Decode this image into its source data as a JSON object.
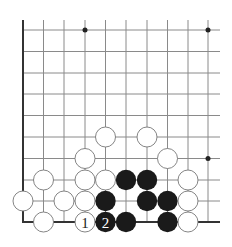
{
  "diagram": {
    "type": "go-board-fragment",
    "corner": "bottom-left",
    "colors": {
      "background": "#ffffff",
      "grid_line": "#8a8a8a",
      "edge_line": "#333333",
      "black_stone": "#1a1a1a",
      "white_stone_fill": "#ffffff",
      "white_stone_stroke": "#777777",
      "star_point": "#222222"
    },
    "grid": {
      "columns_x": [
        23,
        43.5,
        64,
        85,
        105.5,
        126,
        147,
        167.5,
        188,
        208
      ],
      "rows_y": [
        30,
        51.5,
        73,
        94,
        115.5,
        137,
        158.5,
        180,
        201,
        222
      ],
      "extend_top_to": 20,
      "extend_right_to": 220,
      "edges": [
        "left",
        "bottom"
      ]
    },
    "star_points": [
      {
        "col": 3,
        "row": 0
      },
      {
        "col": 9,
        "row": 0
      },
      {
        "col": 9,
        "row": 6
      }
    ],
    "stones": [
      {
        "color": "white",
        "col": 4,
        "row": 5,
        "label": ""
      },
      {
        "color": "white",
        "col": 6,
        "row": 5,
        "label": ""
      },
      {
        "color": "white",
        "col": 3,
        "row": 6,
        "label": ""
      },
      {
        "color": "white",
        "col": 7,
        "row": 6,
        "label": ""
      },
      {
        "color": "white",
        "col": 1,
        "row": 7,
        "label": ""
      },
      {
        "color": "white",
        "col": 3,
        "row": 7,
        "label": ""
      },
      {
        "color": "white",
        "col": 4,
        "row": 7,
        "label": ""
      },
      {
        "color": "black",
        "col": 5,
        "row": 7,
        "label": ""
      },
      {
        "color": "black",
        "col": 6,
        "row": 7,
        "label": ""
      },
      {
        "color": "white",
        "col": 8,
        "row": 7,
        "label": ""
      },
      {
        "color": "white",
        "col": 0,
        "row": 8,
        "label": ""
      },
      {
        "color": "white",
        "col": 2,
        "row": 8,
        "label": ""
      },
      {
        "color": "white",
        "col": 3,
        "row": 8,
        "label": ""
      },
      {
        "color": "black",
        "col": 4,
        "row": 8,
        "label": ""
      },
      {
        "color": "black",
        "col": 6,
        "row": 8,
        "label": ""
      },
      {
        "color": "black",
        "col": 7,
        "row": 8,
        "label": ""
      },
      {
        "color": "white",
        "col": 8,
        "row": 8,
        "label": ""
      },
      {
        "color": "white",
        "col": 1,
        "row": 9,
        "label": ""
      },
      {
        "color": "white",
        "col": 3,
        "row": 9,
        "label": "1"
      },
      {
        "color": "black",
        "col": 4,
        "row": 9,
        "label": "2"
      },
      {
        "color": "black",
        "col": 5,
        "row": 9,
        "label": ""
      },
      {
        "color": "black",
        "col": 7,
        "row": 9,
        "label": ""
      },
      {
        "color": "white",
        "col": 8,
        "row": 9,
        "label": ""
      }
    ],
    "move_labels": [
      "1",
      "2"
    ]
  }
}
